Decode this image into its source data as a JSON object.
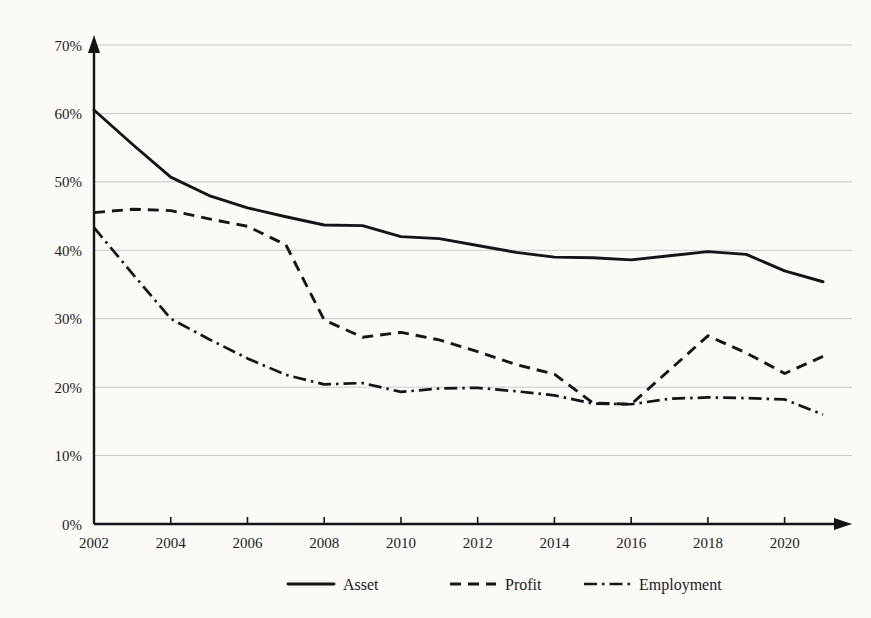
{
  "chart_data": {
    "type": "line",
    "title": "",
    "subtitle": "",
    "xlabel": "",
    "ylabel": "",
    "x": [
      2002,
      2003,
      2004,
      2005,
      2006,
      2007,
      2008,
      2009,
      2010,
      2011,
      2012,
      2013,
      2014,
      2015,
      2016,
      2017,
      2018,
      2019,
      2020,
      2021
    ],
    "xlim": [
      2002,
      2021
    ],
    "ylim": [
      0,
      70
    ],
    "y_unit": "%",
    "grid": "horizontal",
    "legend_position": "bottom",
    "xtick_labels": [
      "2002",
      "2004",
      "2006",
      "2008",
      "2010",
      "2012",
      "2014",
      "2016",
      "2018",
      "2020"
    ],
    "xtick_values": [
      2002,
      2004,
      2006,
      2008,
      2010,
      2012,
      2014,
      2016,
      2018,
      2020
    ],
    "ytick_labels": [
      "0%",
      "10%",
      "20%",
      "30%",
      "40%",
      "50%",
      "60%",
      "70%"
    ],
    "ytick_values": [
      0,
      10,
      20,
      30,
      40,
      50,
      60,
      70
    ],
    "series": [
      {
        "name": "Asset",
        "style": "solid",
        "color": "#151515",
        "values": [
          60.5,
          55.5,
          50.7,
          48.0,
          46.2,
          44.9,
          43.7,
          43.6,
          42.0,
          41.7,
          40.7,
          39.7,
          39.0,
          38.9,
          38.6,
          39.2,
          39.8,
          39.4,
          37.0,
          35.4
        ]
      },
      {
        "name": "Profit",
        "style": "dashed",
        "color": "#151515",
        "values": [
          45.5,
          46.0,
          45.8,
          44.6,
          43.5,
          40.8,
          29.8,
          27.3,
          28.0,
          26.9,
          25.2,
          23.3,
          21.9,
          17.7,
          17.5,
          22.5,
          27.5,
          25.0,
          22.0,
          24.5
        ]
      },
      {
        "name": "Employment",
        "style": "dash-dot",
        "color": "#151515",
        "values": [
          43.3,
          36.6,
          30.0,
          27.0,
          24.2,
          21.8,
          20.4,
          20.6,
          19.3,
          19.8,
          19.9,
          19.4,
          18.8,
          17.6,
          17.5,
          18.3,
          18.5,
          18.4,
          18.2,
          16.0
        ]
      }
    ]
  },
  "legend": {
    "items": [
      {
        "label": "Asset",
        "style": "solid"
      },
      {
        "label": "Profit",
        "style": "dashed"
      },
      {
        "label": "Employment",
        "style": "dash-dot"
      }
    ]
  },
  "colors": {
    "background": "#fbfaf7",
    "ink": "#151515",
    "grid": "#c9c9c9"
  }
}
